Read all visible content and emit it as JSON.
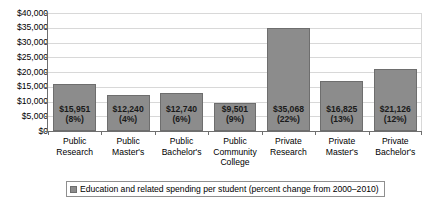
{
  "chart_data": {
    "type": "bar",
    "title": "",
    "subtitle": "",
    "xlabel": "",
    "ylabel": "",
    "ylim": [
      0,
      40000
    ],
    "ytick_step": 5000,
    "grid": true,
    "legend_position": "bottom",
    "bar_color": "#8c8c8c",
    "bar_edge_color": "#6e6e6e",
    "grid_color": "#d8d8d8",
    "axis_color": "#6f6f6f",
    "categories": [
      "Public Research",
      "Public Master's",
      "Public Bachelor's",
      "Public Community College",
      "Private Research",
      "Private Master's",
      "Private Bachelor's"
    ],
    "category_lines": [
      [
        "Public",
        "Research"
      ],
      [
        "Public",
        "Master's"
      ],
      [
        "Public",
        "Bachelor's"
      ],
      [
        "Public",
        "Community",
        "College"
      ],
      [
        "Private",
        "Research"
      ],
      [
        "Private",
        "Master's"
      ],
      [
        "Private",
        "Bachelor's"
      ]
    ],
    "values": [
      15951,
      12240,
      12740,
      9501,
      35068,
      16825,
      21126
    ],
    "value_labels": [
      "$15,951",
      "$12,240",
      "$12,740",
      "$9,501",
      "$35,068",
      "$16,825",
      "$21,126"
    ],
    "percent_labels": [
      "(8%)",
      "(4%)",
      "(6%)",
      "(9%)",
      "(22%)",
      "(13%)",
      "(12%)"
    ],
    "percent_values": [
      8,
      4,
      6,
      9,
      22,
      13,
      12
    ],
    "ytick_labels": [
      "$40,000",
      "$35,000",
      "$30,000",
      "$25,000",
      "$20,000",
      "$15,000",
      "$10,000",
      "$5,000",
      "$0"
    ],
    "ytick_values": [
      40000,
      35000,
      30000,
      25000,
      20000,
      15000,
      10000,
      5000,
      0
    ],
    "series": [
      {
        "name": "Education and related spending per student (percent change from 2000–2010)",
        "values": [
          15951,
          12240,
          12740,
          9501,
          35068,
          16825,
          21126
        ]
      }
    ],
    "legend": [
      "Education and related spending per student (percent change from 2000–2010)"
    ]
  }
}
